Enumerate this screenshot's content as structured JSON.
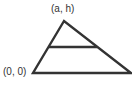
{
  "diagram": {
    "type": "triangle",
    "labels": {
      "apex": "(a, h)",
      "origin": "(0, 0)"
    },
    "stroke_color": "#333333",
    "vertices": {
      "apex": [
        64,
        21
      ],
      "bottom_left": [
        33,
        73
      ],
      "bottom_right": [
        131,
        73
      ]
    },
    "midline": {
      "y": 47,
      "x1": 49,
      "x2": 97
    }
  }
}
